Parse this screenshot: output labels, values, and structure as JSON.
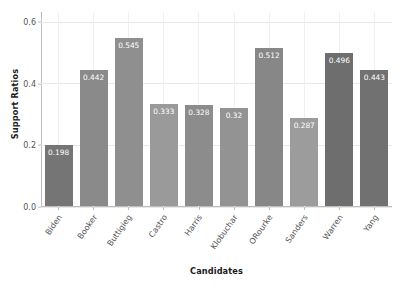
{
  "chart_data": {
    "type": "bar",
    "title": "",
    "xlabel": "Candidates",
    "ylabel": "Support Ratios",
    "categories": [
      "Biden",
      "Booker",
      "Buttigieg",
      "Castro",
      "Harris",
      "Klobuchar",
      "ORourke",
      "Sanders",
      "Warren",
      "Yang"
    ],
    "values": [
      0.198,
      0.442,
      0.545,
      0.333,
      0.328,
      0.32,
      0.512,
      0.287,
      0.496,
      0.443
    ],
    "value_labels": [
      "0.198",
      "0.442",
      "0.545",
      "0.333",
      "0.328",
      "0.32",
      "0.512",
      "0.287",
      "0.496",
      "0.443"
    ],
    "bar_colors": [
      "#757575",
      "#8a8a8a",
      "#8f8f8f",
      "#9a9a9a",
      "#8c8c8c",
      "#939393",
      "#878787",
      "#9c9c9c",
      "#6e6e6e",
      "#717171"
    ],
    "ylim": [
      0.0,
      0.63
    ],
    "yticks": [
      0.0,
      0.2,
      0.4,
      0.6
    ],
    "ytick_labels": [
      "0.0",
      "0.2",
      "0.4",
      "0.6"
    ],
    "grid": true,
    "grid_color": "#e9e9ea",
    "legend": null,
    "background": "#ffffff",
    "axis_color": "#bdbdbd",
    "tick_label_color": "#555557",
    "axis_label_color": "#1a1a1a",
    "value_label_color": "#ffffff"
  }
}
